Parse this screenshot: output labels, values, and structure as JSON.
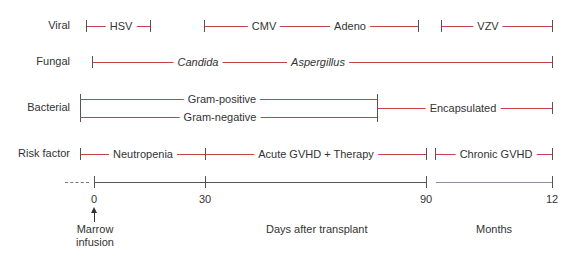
{
  "rows": {
    "viral": {
      "label": "Viral",
      "items": [
        "HSV",
        "CMV",
        "Adeno",
        "VZV"
      ]
    },
    "fungal": {
      "label": "Fungal",
      "items": [
        "Candida",
        "Aspergillus"
      ]
    },
    "bacterial": {
      "label": "Bacterial",
      "items": [
        "Gram-positive",
        "Gram-negative",
        "Encapsulated"
      ]
    },
    "risk": {
      "label": "Risk factor",
      "items": [
        "Neutropenia",
        "Acute GVHD + Therapy",
        "Chronic GVHD"
      ]
    }
  },
  "axis": {
    "ticks": [
      "0",
      "30",
      "90",
      "12"
    ],
    "days_label": "Days after transplant",
    "months_label": "Months",
    "marrow_label_line1": "Marrow",
    "marrow_label_line2": "infusion"
  },
  "colors": {
    "segment": "#c7414b",
    "axis": "#555555"
  }
}
